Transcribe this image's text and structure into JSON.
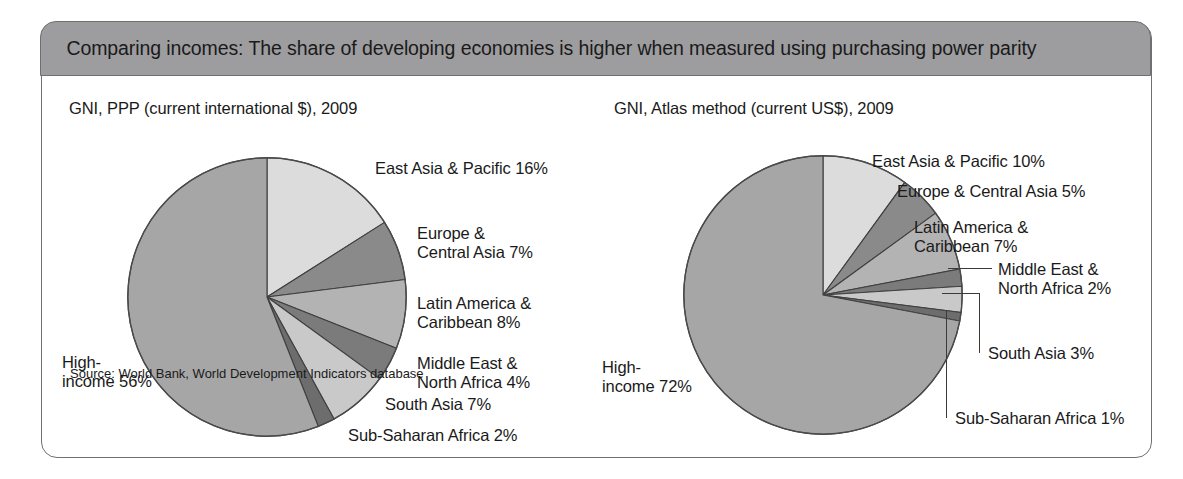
{
  "figure": {
    "banner_title": "Comparing incomes: The share of developing economies is higher when measured using purchasing power parity",
    "source": "Source: World Bank, World Development Indicators database",
    "banner_color": "#9d9d9f",
    "frame_color": "#6f7072"
  },
  "chart_data": [
    {
      "type": "pie",
      "title": "GNI, PPP (current international $), 2009",
      "categories": [
        "East Asia & Pacific",
        "Europe & Central Asia",
        "Latin America & Caribbean",
        "Middle East & North Africa",
        "South Asia",
        "Sub-Saharan Africa",
        "High-income"
      ],
      "values": [
        16,
        7,
        8,
        4,
        7,
        2,
        56
      ],
      "unit": "%",
      "colors": [
        "#dcdcdc",
        "#8a8a8a",
        "#b3b3b3",
        "#7b7b7b",
        "#c9c9c9",
        "#6d6d6d",
        "#a6a6a6"
      ],
      "labels": [
        "East Asia & Pacific 16%",
        "Europe &\nCentral Asia 7%",
        "Latin America &\nCaribbean 8%",
        "Middle East &\nNorth Africa 4%",
        "South Asia 7%",
        "Sub-Saharan Africa 2%",
        "High-\nincome 56%"
      ],
      "start_angle": 0,
      "direction": "clockwise",
      "legend": "callout-labels"
    },
    {
      "type": "pie",
      "title": "GNI, Atlas method (current US$), 2009",
      "categories": [
        "East Asia & Pacific",
        "Europe & Central Asia",
        "Latin America & Caribbean",
        "Middle East & North Africa",
        "South Asia",
        "Sub-Saharan Africa",
        "High-income"
      ],
      "values": [
        10,
        5,
        7,
        2,
        3,
        1,
        72
      ],
      "unit": "%",
      "colors": [
        "#dcdcdc",
        "#8a8a8a",
        "#b3b3b3",
        "#7b7b7b",
        "#c9c9c9",
        "#6d6d6d",
        "#a6a6a6"
      ],
      "labels": [
        "East Asia & Pacific 10%",
        "Europe & Central Asia 5%",
        "Latin America &\nCaribbean 7%",
        "Middle East &\nNorth Africa 2%",
        "South Asia 3%",
        "Sub-Saharan Africa 1%",
        "High-\nincome 72%"
      ],
      "start_angle": 0,
      "direction": "clockwise",
      "legend": "callout-labels"
    }
  ]
}
